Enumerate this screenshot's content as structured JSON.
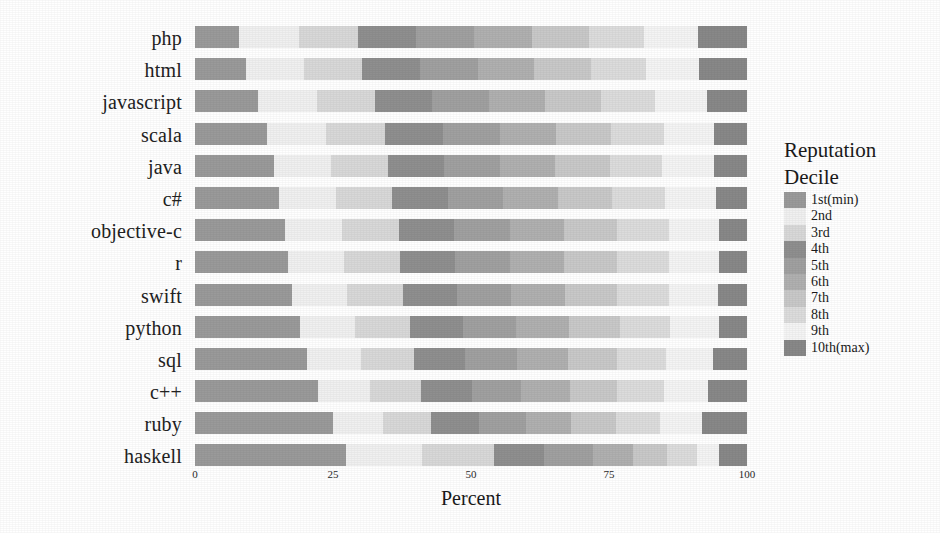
{
  "chart_data": {
    "type": "bar",
    "orientation": "horizontal",
    "stacked": true,
    "normalized_to_percent": true,
    "title": "",
    "xlabel": "Percent",
    "ylabel": "",
    "xlim": [
      0,
      100
    ],
    "xticks": [
      0,
      25,
      50,
      75,
      100
    ],
    "xticklabels": [
      "0",
      "25",
      "50",
      "75",
      "100"
    ],
    "grid": false,
    "legend_position": "right",
    "legend_title": "Reputation Decile",
    "categories": [
      "php",
      "html",
      "javascript",
      "scala",
      "java",
      "c#",
      "objective-c",
      "r",
      "swift",
      "python",
      "sql",
      "c++",
      "ruby",
      "haskell"
    ],
    "series": [
      {
        "name": "1st(min)",
        "color": "#9a9a9a",
        "values": [
          8.0,
          9.2,
          11.5,
          13.0,
          14.3,
          15.2,
          16.3,
          16.8,
          17.5,
          19.0,
          20.2,
          22.2,
          25.0,
          27.3
        ]
      },
      {
        "name": "2nd",
        "color": "#f0f0f0",
        "values": [
          10.8,
          10.5,
          10.6,
          10.8,
          10.4,
          10.3,
          10.4,
          10.2,
          10.1,
          10.0,
          9.8,
          9.5,
          9.0,
          13.8
        ]
      },
      {
        "name": "3rd",
        "color": "#d8d8d8",
        "values": [
          10.7,
          10.6,
          10.5,
          10.7,
          10.3,
          10.2,
          10.2,
          10.1,
          10.0,
          9.9,
          9.6,
          9.3,
          8.8,
          13.0
        ]
      },
      {
        "name": "4th",
        "color": "#8f8f8f",
        "values": [
          10.6,
          10.5,
          10.4,
          10.5,
          10.2,
          10.1,
          10.1,
          10.0,
          9.9,
          9.7,
          9.4,
          9.1,
          8.6,
          9.2
        ]
      },
      {
        "name": "5th",
        "color": "#a0a0a0",
        "values": [
          10.5,
          10.4,
          10.3,
          10.3,
          10.1,
          10.0,
          10.0,
          9.9,
          9.8,
          9.6,
          9.3,
          9.0,
          8.5,
          8.8
        ]
      },
      {
        "name": "6th",
        "color": "#b0b0b0",
        "values": [
          10.4,
          10.3,
          10.2,
          10.1,
          10.0,
          9.9,
          9.8,
          9.8,
          9.7,
          9.5,
          9.2,
          8.8,
          8.3,
          7.2
        ]
      },
      {
        "name": "7th",
        "color": "#c8c8c8",
        "values": [
          10.3,
          10.2,
          10.1,
          9.9,
          9.8,
          9.8,
          9.6,
          9.6,
          9.5,
          9.3,
          9.0,
          8.6,
          8.1,
          6.2
        ]
      },
      {
        "name": "8th",
        "color": "#dcdcdc",
        "values": [
          10.1,
          10.0,
          9.8,
          9.6,
          9.6,
          9.6,
          9.4,
          9.4,
          9.3,
          9.1,
          8.8,
          8.4,
          7.9,
          5.4
        ]
      },
      {
        "name": "9th",
        "color": "#f4f4f4",
        "values": [
          9.8,
          9.6,
          9.4,
          9.2,
          9.3,
          9.3,
          9.1,
          9.1,
          9.0,
          8.8,
          8.5,
          8.1,
          7.6,
          4.1
        ]
      },
      {
        "name": "10th(max)",
        "color": "#888888",
        "values": [
          8.8,
          8.7,
          7.2,
          5.9,
          6.0,
          5.6,
          5.1,
          5.1,
          5.2,
          5.1,
          6.2,
          7.0,
          8.2,
          5.0
        ]
      }
    ]
  },
  "axis": {
    "x_title": "Percent",
    "x_ticklabels": [
      "0",
      "25",
      "50",
      "75",
      "100"
    ]
  },
  "legend": {
    "title_line1": "Reputation",
    "title_line2": "Decile",
    "items": [
      {
        "label": "1st(min)",
        "color": "#9a9a9a"
      },
      {
        "label": "2nd",
        "color": "#f0f0f0"
      },
      {
        "label": "3rd",
        "color": "#d8d8d8"
      },
      {
        "label": "4th",
        "color": "#8f8f8f"
      },
      {
        "label": "5th",
        "color": "#a0a0a0"
      },
      {
        "label": "6th",
        "color": "#b0b0b0"
      },
      {
        "label": "7th",
        "color": "#c8c8c8"
      },
      {
        "label": "8th",
        "color": "#dcdcdc"
      },
      {
        "label": "9th",
        "color": "#f4f4f4"
      },
      {
        "label": "10th(max)",
        "color": "#888888"
      }
    ]
  }
}
